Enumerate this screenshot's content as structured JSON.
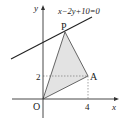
{
  "diagram": {
    "type": "coordinate-plane",
    "axes": {
      "x_label": "x",
      "y_label": "y",
      "origin_label": "O"
    },
    "ticks": {
      "x_tick": "4",
      "y_tick": "2"
    },
    "line": {
      "equation": "x−2y+10=0"
    },
    "points": {
      "P": {
        "label": "P"
      },
      "A": {
        "label": "A",
        "coords": [
          4,
          2
        ]
      },
      "O": {
        "label": "O",
        "coords": [
          0,
          0
        ]
      }
    },
    "triangle": {
      "vertices": [
        "O",
        "P",
        "A"
      ],
      "fill": "#e3e3e3",
      "stroke": "#555555"
    },
    "colors": {
      "axis": "#333333",
      "line": "#222222",
      "dashed": "#666666"
    }
  }
}
